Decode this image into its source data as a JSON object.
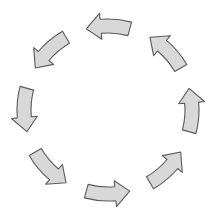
{
  "diagram": {
    "type": "cycle",
    "direction": "counter-clockwise",
    "center": [
      108,
      110
    ],
    "radius": 84,
    "arrow_count": 8,
    "colors": {
      "fill": "#d8d8d8",
      "stroke": "#5a5a5a",
      "background": "#ffffff"
    },
    "arrows": [
      {
        "id": "arrow-top",
        "angle": -90,
        "points": "left"
      },
      {
        "id": "arrow-upper-left",
        "angle": -135,
        "points": "down-left"
      },
      {
        "id": "arrow-left",
        "angle": 180,
        "points": "down"
      },
      {
        "id": "arrow-lower-left",
        "angle": 135,
        "points": "down-right"
      },
      {
        "id": "arrow-bottom",
        "angle": 90,
        "points": "right"
      },
      {
        "id": "arrow-lower-right",
        "angle": 45,
        "points": "up-right"
      },
      {
        "id": "arrow-right",
        "angle": 0,
        "points": "up"
      },
      {
        "id": "arrow-upper-right",
        "angle": -45,
        "points": "up-left"
      }
    ]
  }
}
